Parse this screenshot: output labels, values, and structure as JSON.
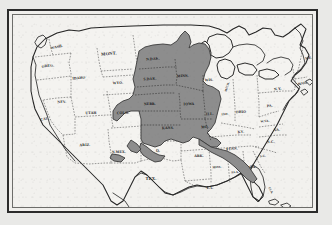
{
  "document": {
    "type": "map",
    "title": "Map of the United States",
    "description": "Black and white printed map of the contiguous United States with a shaded region covering the Upper Midwest, Great Plains and parts of the Mississippi Valley",
    "frame_border_color": "#2b2b2b",
    "page_background_color": "#e9e9e7",
    "map_background_color": "#f2f1ee",
    "shaded_region_color": "#8d8d8d",
    "outline_color": "#242424"
  },
  "ghost_text": [
    {
      "text": "the Seventy-sixth",
      "x": 152,
      "y": 24
    },
    {
      "text": "dumgart of Nebraska",
      "x": 176,
      "y": 92
    },
    {
      "text": "ed a",
      "x": 142,
      "y": 124
    },
    {
      "text": "this area",
      "x": 148,
      "y": 140
    },
    {
      "text": "comparatively",
      "x": 94,
      "y": 160
    },
    {
      "text": "almost entirely agricultural",
      "x": 82,
      "y": 175
    },
    {
      "text": "has social security",
      "x": 98,
      "y": 192
    }
  ],
  "map": {
    "shaded_region_label": "shaded-states-region",
    "shaded_states": [
      "N.DAK.",
      "S.DAK.",
      "MINN.",
      "WIS.",
      "NEBR.",
      "IOWA",
      "ILL.",
      "KANS.",
      "MO."
    ],
    "state_labels": [
      {
        "name": "washington",
        "text": "WASH.",
        "x": 44,
        "y": 33,
        "size": "sz-sm",
        "rotate": -12,
        "shaded": false
      },
      {
        "name": "oregon",
        "text": "OREG.",
        "x": 35,
        "y": 52,
        "size": "sz-sm",
        "rotate": -6,
        "shaded": false
      },
      {
        "name": "idaho",
        "text": "IDAHO",
        "x": 66,
        "y": 64,
        "size": "sz-sm",
        "rotate": -5,
        "shaded": false
      },
      {
        "name": "montana",
        "text": "MONT.",
        "x": 96,
        "y": 40,
        "size": "sz-md",
        "rotate": -5,
        "shaded": false
      },
      {
        "name": "wyoming",
        "text": "WYO.",
        "x": 105,
        "y": 69,
        "size": "sz-sm",
        "rotate": -3,
        "shaded": false
      },
      {
        "name": "nevada",
        "text": "NEV.",
        "x": 49,
        "y": 88,
        "size": "sz-sm",
        "rotate": -4,
        "shaded": false
      },
      {
        "name": "utah",
        "text": "UTAH",
        "x": 78,
        "y": 99,
        "size": "sz-sm",
        "rotate": -2,
        "shaded": false
      },
      {
        "name": "colorado",
        "text": "COLO.",
        "x": 110,
        "y": 99,
        "size": "sz-sm",
        "rotate": -2,
        "shaded": false
      },
      {
        "name": "california",
        "text": "CAL.",
        "x": 32,
        "y": 105,
        "size": "sz-sm",
        "rotate": -10,
        "shaded": false
      },
      {
        "name": "arizona",
        "text": "ARIZ.",
        "x": 72,
        "y": 131,
        "size": "sz-sm",
        "rotate": -2,
        "shaded": false
      },
      {
        "name": "new-mexico",
        "text": "N.MEX.",
        "x": 106,
        "y": 138,
        "size": "sz-sm",
        "rotate": -2,
        "shaded": false
      },
      {
        "name": "texas",
        "text": "TEX.",
        "x": 138,
        "y": 165,
        "size": "sz-md",
        "rotate": 0,
        "shaded": false
      },
      {
        "name": "north-dakota",
        "text": "N.DAK.",
        "x": 140,
        "y": 45,
        "size": "sz-sm",
        "rotate": -4,
        "shaded": true
      },
      {
        "name": "south-dakota",
        "text": "S.DAK.",
        "x": 137,
        "y": 65,
        "size": "sz-sm",
        "rotate": -3,
        "shaded": true
      },
      {
        "name": "minnesota",
        "text": "MINN.",
        "x": 170,
        "y": 62,
        "size": "sz-sm",
        "rotate": -3,
        "shaded": true
      },
      {
        "name": "wisconsin",
        "text": "WIS.",
        "x": 196,
        "y": 66,
        "size": "sz-sm",
        "rotate": -3,
        "shaded": true
      },
      {
        "name": "nebraska",
        "text": "NEBR.",
        "x": 137,
        "y": 90,
        "size": "sz-sm",
        "rotate": -2,
        "shaded": true
      },
      {
        "name": "iowa",
        "text": "IOWA",
        "x": 176,
        "y": 90,
        "size": "sz-sm",
        "rotate": -2,
        "shaded": true
      },
      {
        "name": "illinois",
        "text": "ILL.",
        "x": 197,
        "y": 100,
        "size": "sz-sm",
        "rotate": -4,
        "shaded": true
      },
      {
        "name": "kansas",
        "text": "KANS.",
        "x": 155,
        "y": 114,
        "size": "sz-sm",
        "rotate": -2,
        "shaded": true
      },
      {
        "name": "missouri",
        "text": "MO.",
        "x": 192,
        "y": 113,
        "size": "sz-sm",
        "rotate": -3,
        "shaded": true
      },
      {
        "name": "oklahoma",
        "text": "O.",
        "x": 145,
        "y": 137,
        "size": "sz-sm",
        "rotate": 0,
        "shaded": false
      },
      {
        "name": "arkansas",
        "text": "ARK.",
        "x": 186,
        "y": 142,
        "size": "sz-sm",
        "rotate": -1,
        "shaded": false
      },
      {
        "name": "louisiana",
        "text": "LA.",
        "x": 197,
        "y": 174,
        "size": "sz-sm",
        "rotate": 0,
        "shaded": false
      },
      {
        "name": "mississippi",
        "text": "MISS.",
        "x": 204,
        "y": 153,
        "size": "sz-xs",
        "rotate": -2,
        "shaded": false
      },
      {
        "name": "alabama",
        "text": "ALA.",
        "x": 222,
        "y": 158,
        "size": "sz-xs",
        "rotate": -2,
        "shaded": false
      },
      {
        "name": "georgia",
        "text": "GA.",
        "x": 240,
        "y": 153,
        "size": "sz-sm",
        "rotate": -2,
        "shaded": false
      },
      {
        "name": "tennessee",
        "text": "TENN.",
        "x": 219,
        "y": 135,
        "size": "sz-sm",
        "rotate": -5,
        "shaded": false
      },
      {
        "name": "kentucky",
        "text": "KY.",
        "x": 228,
        "y": 118,
        "size": "sz-sm",
        "rotate": -5,
        "shaded": false
      },
      {
        "name": "indiana",
        "text": "IND.",
        "x": 212,
        "y": 100,
        "size": "sz-xs",
        "rotate": -4,
        "shaded": false
      },
      {
        "name": "ohio",
        "text": "OHIO",
        "x": 228,
        "y": 98,
        "size": "sz-sm",
        "rotate": -3,
        "shaded": false
      },
      {
        "name": "michigan",
        "text": "MICH.",
        "x": 215,
        "y": 72,
        "size": "sz-xs",
        "rotate": -72,
        "shaded": false
      },
      {
        "name": "pennsylvania",
        "text": "PA.",
        "x": 257,
        "y": 92,
        "size": "sz-sm",
        "rotate": -6,
        "shaded": false
      },
      {
        "name": "new-york",
        "text": "N.Y.",
        "x": 265,
        "y": 75,
        "size": "sz-sm",
        "rotate": -8,
        "shaded": false
      },
      {
        "name": "maine",
        "text": "ME.",
        "x": 296,
        "y": 44,
        "size": "sz-sm",
        "rotate": -12,
        "shaded": false
      },
      {
        "name": "massachusetts",
        "text": "MASS.",
        "x": 290,
        "y": 69,
        "size": "sz-xs",
        "rotate": -10,
        "shaded": false
      },
      {
        "name": "west-virginia",
        "text": "W.VA.",
        "x": 252,
        "y": 107,
        "size": "sz-xs",
        "rotate": -5,
        "shaded": false
      },
      {
        "name": "virginia",
        "text": "VA.",
        "x": 264,
        "y": 116,
        "size": "sz-sm",
        "rotate": -5,
        "shaded": false
      },
      {
        "name": "north-carolina",
        "text": "N.C.",
        "x": 258,
        "y": 128,
        "size": "sz-sm",
        "rotate": -4,
        "shaded": false
      },
      {
        "name": "south-carolina",
        "text": "S.C.",
        "x": 250,
        "y": 142,
        "size": "sz-xs",
        "rotate": -4,
        "shaded": false
      },
      {
        "name": "florida",
        "text": "FLA.",
        "x": 257,
        "y": 176,
        "size": "sz-xs",
        "rotate": 62,
        "shaded": false
      }
    ]
  }
}
